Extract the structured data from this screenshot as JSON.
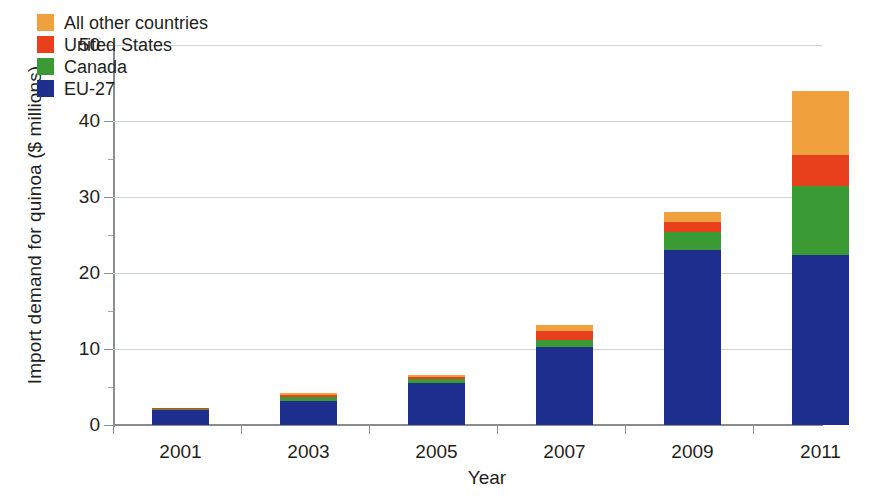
{
  "chart_data": {
    "type": "bar",
    "stacked": true,
    "title": "",
    "xlabel": "Year",
    "ylabel": "Import demand for quinoa ($ millions)",
    "categories": [
      "2001",
      "2003",
      "2005",
      "2007",
      "2009",
      "2011"
    ],
    "ylim": [
      0,
      50
    ],
    "yticks": [
      0,
      10,
      20,
      30,
      40,
      50
    ],
    "ytick_labels": [
      "0",
      "10",
      "20",
      "30",
      "40",
      "50"
    ],
    "grid": "horizontal",
    "legend_position": "top-left",
    "series": [
      {
        "name": "EU-27",
        "color": "#1f2f8f",
        "values": [
          2.0,
          3.2,
          5.5,
          10.3,
          23.0,
          22.4
        ]
      },
      {
        "name": "Canada",
        "color": "#3a9a34",
        "values": [
          0.1,
          0.5,
          0.5,
          0.9,
          2.4,
          9.1
        ]
      },
      {
        "name": "United States",
        "color": "#e8401c",
        "values": [
          0.2,
          0.3,
          0.3,
          1.2,
          1.3,
          4.0
        ]
      },
      {
        "name": "All other countries",
        "color": "#f0a03c",
        "values": [
          0.0,
          0.2,
          0.3,
          0.8,
          1.3,
          8.5
        ]
      }
    ],
    "totals": [
      2.3,
      4.2,
      6.6,
      13.2,
      28.0,
      44.0
    ],
    "legend_order": [
      "All other countries",
      "United States",
      "Canada",
      "EU-27"
    ]
  },
  "legend": {
    "items": [
      {
        "label": "All other countries",
        "color": "#f0a03c"
      },
      {
        "label": "United States",
        "color": "#e8401c"
      },
      {
        "label": "Canada",
        "color": "#3a9a34"
      },
      {
        "label": "EU-27",
        "color": "#1f2f8f"
      }
    ]
  },
  "axes": {
    "y_title": "Import demand for quinoa ($ millions)",
    "x_title": "Year",
    "y_ticks": [
      "0",
      "10",
      "20",
      "30",
      "40",
      "50"
    ],
    "x_ticks": [
      "2001",
      "2003",
      "2005",
      "2007",
      "2009",
      "2011"
    ]
  }
}
